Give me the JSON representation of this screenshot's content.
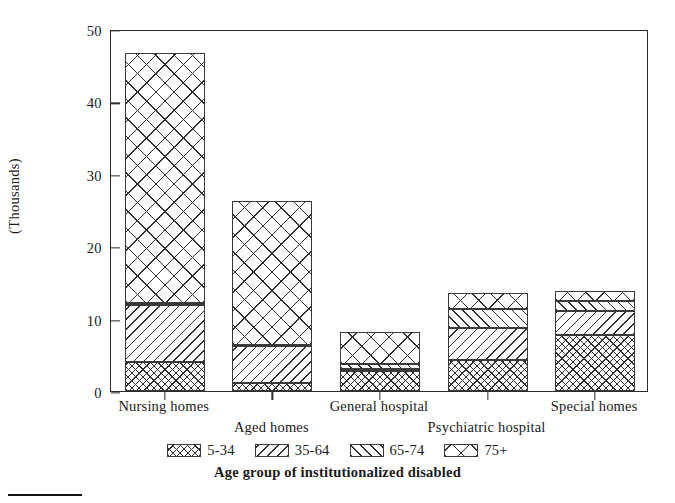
{
  "chart_data": {
    "type": "bar",
    "subtype": "stacked-bar",
    "title": "",
    "xlabel": "Age group of institutionalized disabled",
    "ylabel": "(Thousands)",
    "ylim": [
      0,
      50
    ],
    "yticks": [
      0,
      10,
      20,
      30,
      40,
      50
    ],
    "grid": false,
    "legend_position": "bottom",
    "categories": [
      "Nursing homes",
      "Aged homes",
      "General hospital",
      "Psychiatric hospital",
      "Special homes"
    ],
    "series": [
      {
        "name": "5-34",
        "pattern": "dense-crosshatch",
        "values": [
          4.0,
          1.1,
          2.7,
          4.3,
          7.7
        ]
      },
      {
        "name": "35-64",
        "pattern": "backslash-diagonal",
        "values": [
          7.9,
          5.1,
          0.3,
          4.4,
          3.3
        ]
      },
      {
        "name": "65-74",
        "pattern": "forwardslash-diagonal",
        "values": [
          0.3,
          0.2,
          0.7,
          2.6,
          1.4
        ]
      },
      {
        "name": "75+",
        "pattern": "coarse-crosshatch",
        "values": [
          34.5,
          19.9,
          4.5,
          2.3,
          1.4
        ]
      }
    ],
    "totals": [
      46.7,
      26.3,
      8.2,
      13.6,
      13.8
    ]
  },
  "axis": {
    "y_tick_labels": [
      "0",
      "10",
      "20",
      "30",
      "40",
      "50"
    ],
    "y_axis_title": "(Thousands)",
    "x_axis_title": "Age group of institutionalized disabled",
    "x_tick_labels": [
      "Nursing homes",
      "Aged homes",
      "General hospital",
      "Psychiatric hospital",
      "Special homes"
    ]
  },
  "legend": {
    "items": [
      {
        "label": "5-34"
      },
      {
        "label": "35-64"
      },
      {
        "label": "65-74"
      },
      {
        "label": "75+"
      }
    ]
  },
  "colors": {
    "background": "#ffffff",
    "ink": "#2b2b2b",
    "hatch": "#2f2f2f"
  }
}
